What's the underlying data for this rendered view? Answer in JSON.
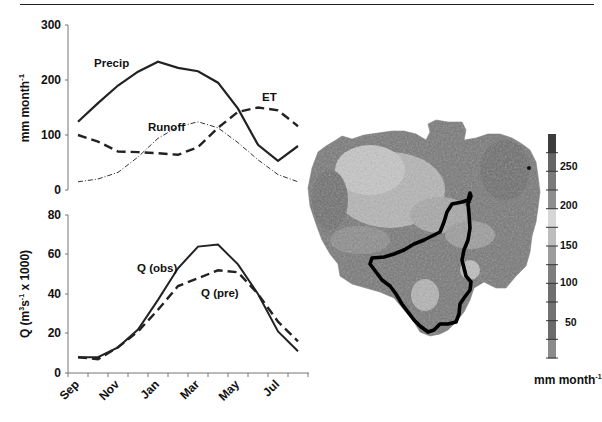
{
  "chart_data": [
    {
      "type": "line",
      "panel": "top",
      "title": "",
      "xlabel": "",
      "ylabel": "mm month-1",
      "ylim": [
        0,
        300
      ],
      "yticks": [
        0,
        100,
        200,
        300
      ],
      "grid": false,
      "x": [
        "Sep",
        "Oct",
        "Nov",
        "Dec",
        "Jan",
        "Feb",
        "Mar",
        "Apr",
        "May",
        "Jun",
        "Jul",
        "Aug"
      ],
      "series": [
        {
          "name": "Precip",
          "style": "solid",
          "values": [
            124,
            158,
            190,
            215,
            233,
            222,
            216,
            195,
            148,
            82,
            53,
            80
          ]
        },
        {
          "name": "ET",
          "style": "dashed",
          "values": [
            100,
            88,
            70,
            69,
            67,
            64,
            78,
            113,
            142,
            150,
            145,
            116
          ]
        },
        {
          "name": "Runoff",
          "style": "dash-dot",
          "values": [
            15,
            20,
            32,
            60,
            94,
            115,
            124,
            113,
            86,
            55,
            28,
            15
          ]
        }
      ],
      "annotations": [
        "Precip",
        "ET",
        "Runoff"
      ]
    },
    {
      "type": "line",
      "panel": "bottom",
      "title": "",
      "xlabel": "",
      "ylabel": "Q (m3s-1 x 1000)",
      "ylim": [
        0,
        80
      ],
      "yticks": [
        0,
        20,
        40,
        60,
        80
      ],
      "grid": false,
      "x": [
        "Sep",
        "Oct",
        "Nov",
        "Dec",
        "Jan",
        "Feb",
        "Mar",
        "Apr",
        "May",
        "Jun",
        "Jul",
        "Aug"
      ],
      "xtick_labels": [
        "Sep",
        "Nov",
        "Jan",
        "Mar",
        "May",
        "Jul"
      ],
      "series": [
        {
          "name": "Q (obs)",
          "style": "solid",
          "values": [
            8,
            8,
            13,
            22,
            37,
            53,
            64,
            65,
            55,
            40,
            21,
            11
          ]
        },
        {
          "name": "Q (pre)",
          "style": "dashed",
          "values": [
            8,
            7,
            13,
            21,
            32,
            44,
            48,
            52,
            51,
            40,
            26,
            16
          ]
        }
      ],
      "annotations": [
        "Q (obs)",
        "Q (pre)"
      ]
    },
    {
      "type": "heatmap",
      "panel": "map",
      "title": "",
      "colorbar_label": "mm month-1",
      "colorbar_ticks": [
        50,
        100,
        150,
        200,
        250
      ],
      "colorbar_range": [
        0,
        290
      ],
      "colorbar_bands": [
        "#3c3c3c",
        "#656565",
        "#7a7a7a",
        "#8e8e8e",
        "#d6d6d6",
        "#bdbdbd",
        "#9c9c9c",
        "#7e7e7e",
        "#6f6f6f",
        "#727272",
        "#6b6b6b",
        "#8a8a8a"
      ],
      "description": "Grayscale map of basin with sub-basin outlined in bold black"
    }
  ],
  "top_panel": {
    "ylabel": "mm month",
    "ylabel_sup": "-1",
    "yticks": [
      "300",
      "200",
      "100",
      "0"
    ],
    "labels": {
      "precip": "Precip",
      "et": "ET",
      "runoff": "Runoff"
    }
  },
  "bottom_panel": {
    "ylabel_main": "Q (m",
    "ylabel_sup1": "3",
    "ylabel_mid": "s",
    "ylabel_sup2": "-1",
    "ylabel_end": " x 1000)",
    "yticks": [
      "80",
      "60",
      "40",
      "20",
      "0"
    ],
    "xticks": [
      "Sep",
      "Nov",
      "Jan",
      "Mar",
      "May",
      "Jul"
    ],
    "labels": {
      "obs": "Q (obs)",
      "pre": "Q (pre)"
    }
  },
  "colorbar": {
    "ticks": [
      "250",
      "200",
      "150",
      "100",
      "50"
    ],
    "unit": "mm month",
    "unit_sup": "-1"
  }
}
